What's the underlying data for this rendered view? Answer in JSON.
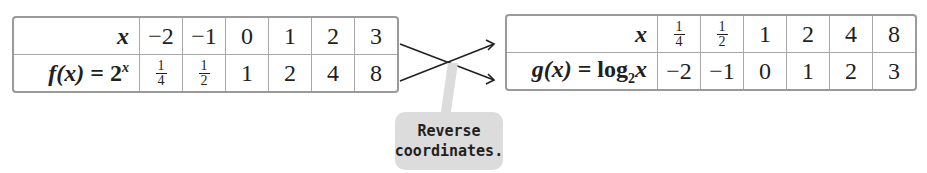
{
  "table_left": {
    "row1_label": "x",
    "row2_label_func": "f(x)",
    "row2_label_eq": "= 2",
    "row2_label_exp": "x",
    "x_values": [
      "−2",
      "−1",
      "0",
      "1",
      "2",
      "3"
    ],
    "y_values": [
      {
        "num": "1",
        "den": "4"
      },
      {
        "num": "1",
        "den": "2"
      },
      "1",
      "2",
      "4",
      "8"
    ]
  },
  "table_right": {
    "row1_label": "x",
    "row2_label_func": "g(x)",
    "row2_label_eq": "= log",
    "row2_label_sub": "2",
    "row2_label_var": "x",
    "x_values": [
      {
        "num": "1",
        "den": "4"
      },
      {
        "num": "1",
        "den": "2"
      },
      "1",
      "2",
      "4",
      "8"
    ],
    "y_values": [
      "−2",
      "−1",
      "0",
      "1",
      "2",
      "3"
    ]
  },
  "callout": {
    "line1": "Reverse",
    "line2": "coordinates."
  },
  "colors": {
    "border": "#9a9a9a",
    "callout_bg": "#dcdcdc",
    "text": "#231f20"
  }
}
